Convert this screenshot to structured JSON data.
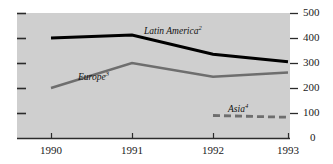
{
  "chart_data": {
    "type": "line",
    "title": "",
    "subtitle": "",
    "xlabel": "",
    "ylabel": "",
    "categories": [
      "1990",
      "1991",
      "1992",
      "1993"
    ],
    "x": [
      1990,
      1991,
      1992,
      1993
    ],
    "xlim": [
      1989.6,
      1993.4
    ],
    "ylim": [
      0,
      500
    ],
    "yticks": [
      0,
      100,
      200,
      300,
      400,
      500
    ],
    "ytick_labels": [
      "0",
      "100",
      "200",
      "300",
      "400",
      "500"
    ],
    "xtick_labels": [
      "1990",
      "1991",
      "1992",
      "1993"
    ],
    "grid": false,
    "legend": "inline-annotations",
    "y_axis_position": "right",
    "plot_background": "#cfcfcf",
    "series": [
      {
        "name": "Latin America",
        "footnote": "2",
        "label": "Latin America",
        "color": "#000000",
        "style": "solid",
        "width": 3,
        "x": [
          1990,
          1991,
          1992,
          1993
        ],
        "values": [
          400,
          412,
          335,
          305
        ]
      },
      {
        "name": "Europe",
        "footnote": "3",
        "label": "Europe",
        "color": "#6e6e6e",
        "style": "solid",
        "width": 2.4,
        "x": [
          1990,
          1991,
          1992,
          1993
        ],
        "values": [
          200,
          300,
          245,
          262
        ]
      },
      {
        "name": "Asia",
        "footnote": "4",
        "label": "Asia",
        "color": "#6e6e6e",
        "style": "dashed",
        "width": 2.8,
        "x": [
          1992,
          1993
        ],
        "values": [
          90,
          83
        ]
      }
    ],
    "annotations": [
      {
        "text": "Latin America",
        "footnote": "2",
        "x_px": 144,
        "y_px": 27
      },
      {
        "text": "Europe",
        "footnote": "3",
        "x_px": 78,
        "y_px": 73
      },
      {
        "text": "Asia",
        "footnote": "4",
        "x_px": 228,
        "y_px": 105
      }
    ]
  },
  "ticks": {
    "y": [
      {
        "label": "500",
        "y_px": 13
      },
      {
        "label": "400",
        "y_px": 38
      },
      {
        "label": "300",
        "y_px": 63
      },
      {
        "label": "200",
        "y_px": 88
      },
      {
        "label": "100",
        "y_px": 113
      },
      {
        "label": "0",
        "y_px": 138
      }
    ],
    "x": [
      {
        "label": "1990",
        "x_px": 51
      },
      {
        "label": "1991",
        "x_px": 132
      },
      {
        "label": "1992",
        "x_px": 213
      },
      {
        "label": "1993",
        "x_px": 288
      }
    ]
  }
}
